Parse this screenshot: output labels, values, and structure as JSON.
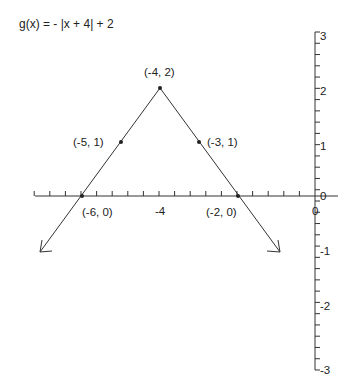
{
  "chart_data": {
    "type": "line",
    "title": "g(x) = - |x + 4| + 2",
    "xlabel": "",
    "ylabel": "",
    "xlim": [
      -7,
      0.5
    ],
    "ylim": [
      -3,
      3
    ],
    "grid": false,
    "x_tick_labels": [
      "-4",
      "0"
    ],
    "y_tick_labels": [
      "3",
      "2",
      "1",
      "0",
      "-1",
      "-2",
      "-3"
    ],
    "series": [
      {
        "name": "g(x)",
        "x": [
          -7,
          -6,
          -5,
          -4,
          -3,
          -2,
          -1
        ],
        "values": [
          -1,
          0,
          1,
          2,
          1,
          0,
          -1
        ]
      }
    ],
    "points": [
      {
        "x": -4,
        "y": 2,
        "label": "(-4, 2)"
      },
      {
        "x": -5,
        "y": 1,
        "label": "(-5, 1)"
      },
      {
        "x": -3,
        "y": 1,
        "label": "(-3, 1)"
      },
      {
        "x": -6,
        "y": 0,
        "label": "(-6, 0)"
      },
      {
        "x": -2,
        "y": 0,
        "label": "(-2, 0)"
      }
    ],
    "annotations": [
      "arrows at both ends of graph"
    ]
  },
  "labels": {
    "title": "g(x) = - |x + 4| + 2",
    "p_vertex": "(-4, 2)",
    "p_left1": "(-5, 1)",
    "p_right1": "(-3, 1)",
    "p_left0": "(-6, 0)",
    "p_right0": "(-2, 0)",
    "x_m4": "-4",
    "x_0": "0",
    "y_3": "3",
    "y_2": "2",
    "y_1": "1",
    "y_0": "0",
    "y_m1": "-1",
    "y_m2": "-2",
    "y_m3": "-3"
  }
}
